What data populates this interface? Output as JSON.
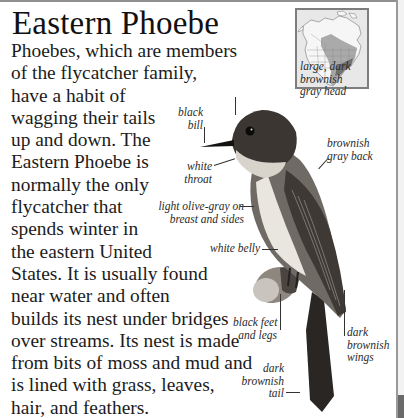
{
  "page": {
    "title": "Eastern Phoebe",
    "body_lines": [
      "Phoebes, which are members",
      "of the flycatcher family,",
      "have a habit of",
      "wagging their tails",
      "up and down. The",
      "Eastern Phoebe is",
      "normally the only",
      "flycatcher that",
      "spends winter in",
      "the eastern United",
      "States. It is usually found",
      "near water and often",
      "builds its nest under bridges",
      "over streams. Its nest is made",
      "from bits of moss and mud and",
      "is lined with grass, leaves,",
      "hair, and feathers."
    ]
  },
  "range_map": {
    "description": "North America range map",
    "colors": {
      "land": "#f4f4f4",
      "breeding": "#a9a9a9",
      "year_round": "#6e6e6e",
      "frame": "#7d7d7d"
    }
  },
  "bird_labels": {
    "head": [
      "large, dark",
      "brownish",
      "gray head"
    ],
    "bill": [
      "black",
      "bill"
    ],
    "back": [
      "brownish",
      "gray back"
    ],
    "throat": [
      "white",
      "throat"
    ],
    "breast": [
      "light olive-gray on",
      "breast and sides"
    ],
    "belly": [
      "white belly"
    ],
    "feet": [
      "black feet",
      "and legs"
    ],
    "wings": [
      "dark",
      "brownish",
      "wings"
    ],
    "tail": [
      "dark",
      "brownish",
      "tail"
    ]
  }
}
